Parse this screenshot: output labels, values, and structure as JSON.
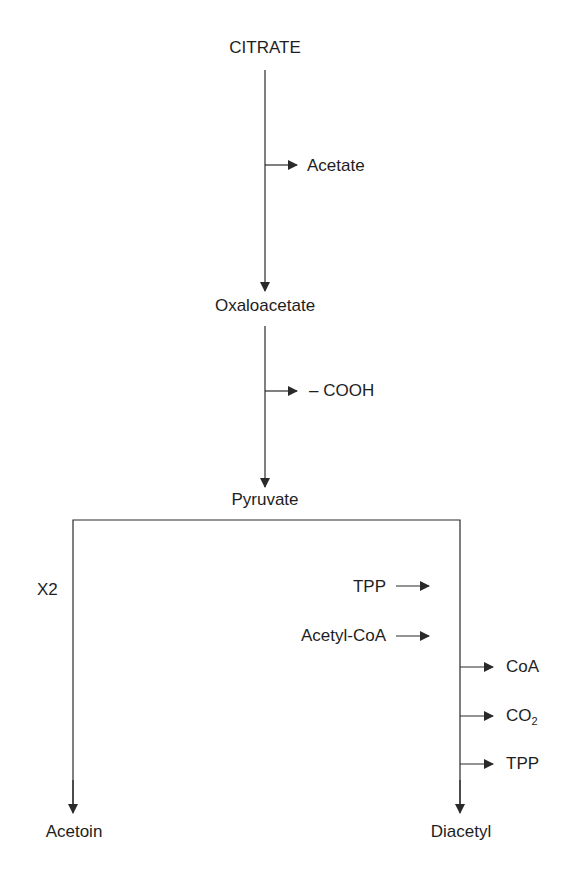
{
  "diagram": {
    "nodes": {
      "citrate": "CITRATE",
      "oxaloacetate": "Oxaloacetate",
      "pyruvate": "Pyruvate",
      "acetoin": "Acetoin",
      "diacetyl": "Diacetyl"
    },
    "side_products": {
      "acetate": "Acetate",
      "cooh": "– COOH",
      "coa": "CoA",
      "co2_main": "CO",
      "co2_sub": "2",
      "tpp_out": "TPP"
    },
    "inputs": {
      "tpp_in": "TPP",
      "acetyl_coa": "Acetyl-CoA"
    },
    "annotations": {
      "x2": "X2"
    },
    "edges": [
      {
        "from": "CITRATE",
        "to": "Oxaloacetate",
        "releases": [
          "Acetate"
        ]
      },
      {
        "from": "Oxaloacetate",
        "to": "Pyruvate",
        "releases": [
          "– COOH"
        ]
      },
      {
        "from": "Pyruvate",
        "to": "Acetoin",
        "label": "X2"
      },
      {
        "from": "Pyruvate",
        "to": "Diacetyl",
        "inputs": [
          "TPP",
          "Acetyl-CoA"
        ],
        "releases": [
          "CoA",
          "CO2",
          "TPP"
        ]
      }
    ],
    "colors": {
      "line": "#2a2a2a",
      "text": "#1e1e1e",
      "background": "#ffffff"
    }
  }
}
